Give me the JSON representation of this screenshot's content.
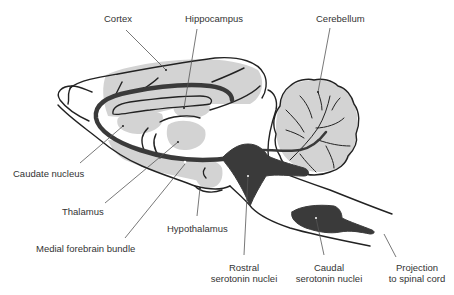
{
  "diagram": {
    "colors": {
      "background": "#ffffff",
      "outline": "#222222",
      "region_fill": "#d2d2d2",
      "nuclei_fill": "#3a3a3a",
      "pointer_line": "#555555"
    },
    "labels": {
      "cortex": "Cortex",
      "hippocampus": "Hippocampus",
      "cerebellum": "Cerebellum",
      "caudate_nucleus": "Caudate nucleus",
      "thalamus": "Thalamus",
      "hypothalamus": "Hypothalamus",
      "medial_forebrain_bundle": "Medial forebrain bundle",
      "rostral_line1": "Rostral",
      "rostral_line2": "serotonin nuclei",
      "caudal_line1": "Caudal",
      "caudal_line2": "serotonin nuclei",
      "projection_line1": "Projection",
      "projection_line2": "to spinal cord"
    }
  }
}
